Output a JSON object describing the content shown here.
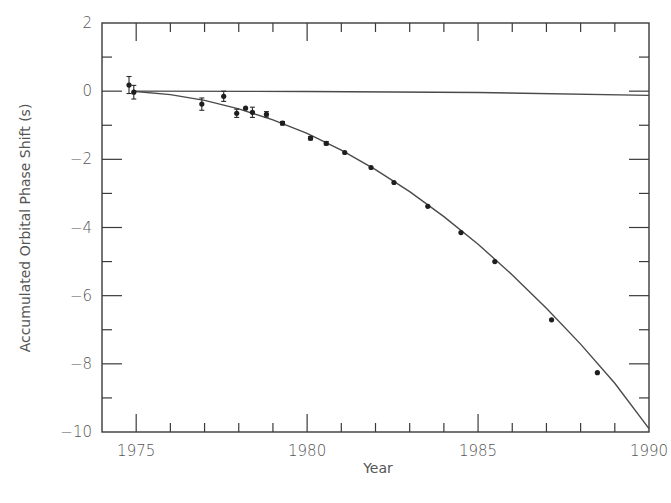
{
  "chart_data": {
    "type": "scatter",
    "title": "",
    "xlabel": "Year",
    "ylabel": "Accumulated Orbital Phase Shift (s)",
    "xlim": [
      1974,
      1990
    ],
    "ylim": [
      -10,
      2
    ],
    "x_ticks": [
      1975,
      1980,
      1985,
      1990
    ],
    "x_minor_step": 1,
    "y_ticks": [
      2,
      0,
      -2,
      -4,
      -6,
      -8,
      -10
    ],
    "y_minor_step": 1,
    "grid": false,
    "legend": null,
    "series": [
      {
        "name": "Measured phase shift",
        "type": "scatter",
        "x": [
          1974.79,
          1974.93,
          1976.92,
          1977.56,
          1977.94,
          1978.2,
          1978.4,
          1978.81,
          1979.28,
          1980.1,
          1980.56,
          1981.1,
          1981.87,
          1982.54,
          1983.53,
          1984.5,
          1985.49,
          1987.15,
          1988.49
        ],
        "y": [
          0.18,
          -0.03,
          -0.38,
          -0.15,
          -0.65,
          -0.5,
          -0.62,
          -0.68,
          -0.94,
          -1.38,
          -1.53,
          -1.8,
          -2.24,
          -2.68,
          -3.38,
          -4.15,
          -5.0,
          -6.71,
          -8.26
        ],
        "yerr": [
          0.25,
          0.2,
          0.18,
          0.15,
          0.12,
          0.0,
          0.15,
          0.08,
          0.05,
          0.05,
          0.05,
          0.03,
          0.03,
          0.03,
          0.03,
          0.03,
          0.03,
          0.03,
          0.03
        ]
      },
      {
        "name": "General relativity prediction (fit curve)",
        "type": "line",
        "x": [
          1974.9,
          1976,
          1977,
          1978,
          1979,
          1980,
          1981,
          1982,
          1983,
          1984,
          1985,
          1986,
          1987,
          1988,
          1989,
          1990
        ],
        "y": [
          0.0,
          -0.1,
          -0.27,
          -0.52,
          -0.84,
          -1.24,
          -1.73,
          -2.3,
          -2.95,
          -3.68,
          -4.49,
          -5.39,
          -6.37,
          -7.42,
          -8.57,
          -9.9
        ]
      },
      {
        "name": "Zero-shift reference",
        "type": "line",
        "x": [
          1974.9,
          1980,
          1985,
          1990
        ],
        "y": [
          0.0,
          -0.01,
          -0.04,
          -0.12
        ]
      }
    ]
  }
}
